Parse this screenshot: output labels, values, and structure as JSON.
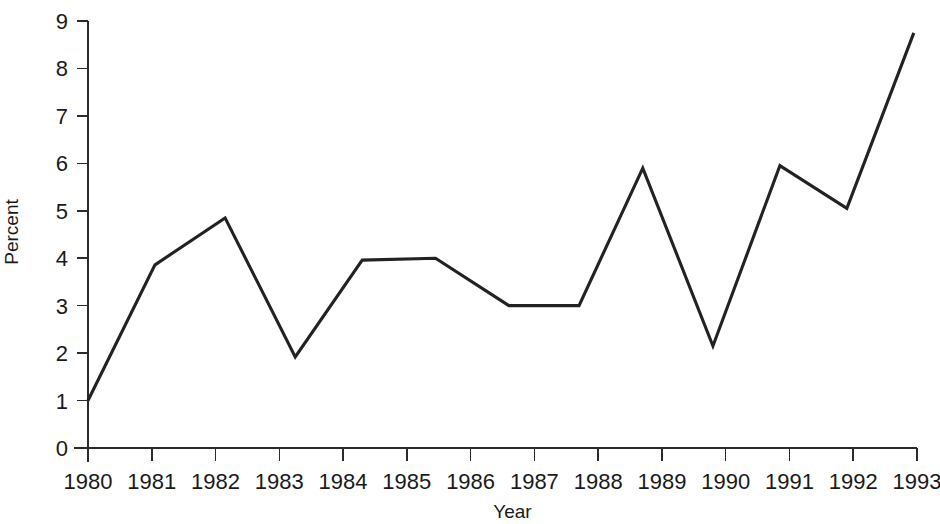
{
  "chart_data": {
    "type": "line",
    "title": "",
    "xlabel": "Year",
    "ylabel": "Percent",
    "x": [
      1980,
      1981,
      1982,
      1983,
      1984,
      1985,
      1986,
      1987,
      1988,
      1989,
      1990,
      1991,
      1992,
      1993
    ],
    "categories": [
      "1980",
      "1981",
      "1982",
      "1983",
      "1984",
      "1985",
      "1986",
      "1987",
      "1988",
      "1989",
      "1990",
      "1991",
      "1992",
      "1993"
    ],
    "values": [
      1.0,
      3.85,
      4.85,
      1.95,
      3.95,
      4.0,
      3.95,
      3.0,
      3.0,
      5.9,
      2.15,
      5.95,
      5.05,
      8.75
    ],
    "series": [
      {
        "name": "Percent",
        "values": [
          1.0,
          3.85,
          4.85,
          1.95,
          3.95,
          4.0,
          3.95,
          3.0,
          3.0,
          5.9,
          2.15,
          5.95,
          5.05,
          8.75
        ],
        "color": "#222222"
      }
    ],
    "vertices": [
      {
        "x": 1980.0,
        "y": 1.0
      },
      {
        "x": 1981.05,
        "y": 3.86
      },
      {
        "x": 1982.15,
        "y": 4.85
      },
      {
        "x": 1983.25,
        "y": 1.92
      },
      {
        "x": 1984.3,
        "y": 3.96
      },
      {
        "x": 1985.45,
        "y": 4.0
      },
      {
        "x": 1986.6,
        "y": 3.0
      },
      {
        "x": 1987.7,
        "y": 3.0
      },
      {
        "x": 1988.7,
        "y": 5.9
      },
      {
        "x": 1989.8,
        "y": 2.15
      },
      {
        "x": 1990.85,
        "y": 5.95
      },
      {
        "x": 1991.9,
        "y": 5.05
      },
      {
        "x": 1992.95,
        "y": 8.75
      }
    ],
    "ylim": [
      0,
      9
    ],
    "xlim": [
      1980,
      1993
    ],
    "y_ticks": [
      0,
      1,
      2,
      3,
      4,
      5,
      6,
      7,
      8,
      9
    ],
    "y_tick_labels": [
      "0",
      "1",
      "2",
      "3",
      "4",
      "5",
      "6",
      "7",
      "8",
      "9"
    ],
    "x_ticks": [
      1980,
      1981,
      1982,
      1983,
      1984,
      1985,
      1986,
      1987,
      1988,
      1989,
      1990,
      1991,
      1992,
      1993
    ],
    "x_tick_labels": [
      "1980",
      "1981",
      "1982",
      "1983",
      "1984",
      "1985",
      "1986",
      "1987",
      "1988",
      "1989",
      "1990",
      "1991",
      "1992",
      "1993"
    ],
    "grid": false,
    "legend": false,
    "legend_position": "none",
    "line_color": "#222222",
    "axis_color": "#2b2b2b",
    "background_color": "#ffffff"
  },
  "axes": {
    "y_axis_title": "Percent",
    "x_axis_title": "Year"
  }
}
